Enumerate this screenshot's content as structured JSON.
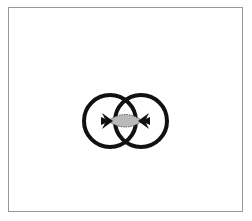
{
  "diagram": {
    "type": "interlocking-rings",
    "frame": {
      "border_color": "#9a9a9a",
      "background": "#ffffff"
    },
    "rings": [
      {
        "name": "left-ring",
        "cx": 110,
        "cy": 121,
        "r": 26,
        "stroke": "#111111",
        "stroke_width": 4
      },
      {
        "name": "right-ring",
        "cx": 141,
        "cy": 121,
        "r": 26,
        "stroke": "#111111",
        "stroke_width": 4
      }
    ],
    "intersection": {
      "fill": "#b9b9b9",
      "stroke": "#222222"
    },
    "arrows": [
      {
        "name": "left-arrow",
        "direction": "inward"
      },
      {
        "name": "right-arrow",
        "direction": "inward"
      }
    ]
  }
}
